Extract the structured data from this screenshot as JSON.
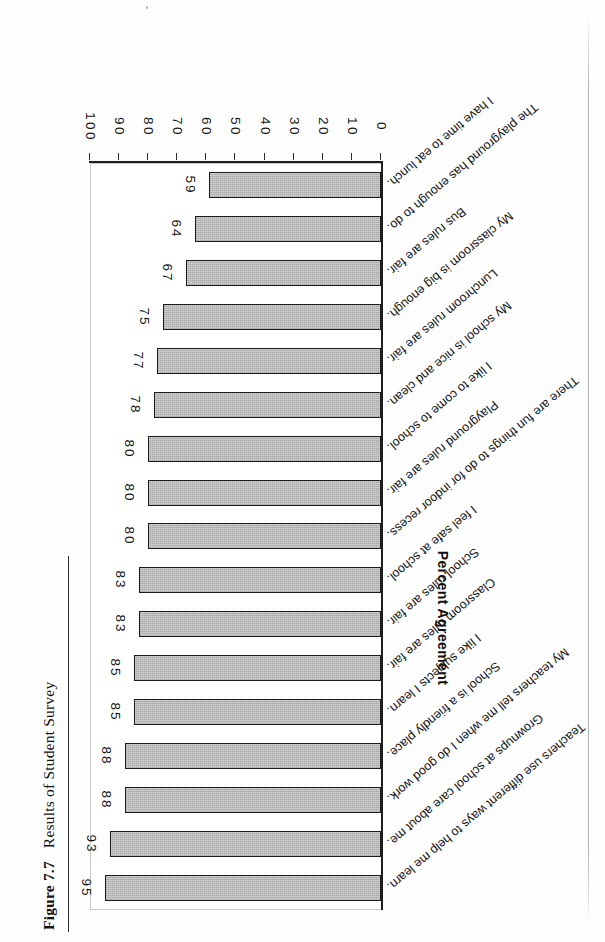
{
  "page": {
    "background_color": "#fefefe",
    "ink_color": "#141414"
  },
  "caption": {
    "label": "Figure 7.7",
    "title": "Results of Student Survey"
  },
  "chart_data": {
    "type": "bar",
    "orientation": "vertical",
    "title": "Results of Student Survey",
    "xlabel": "",
    "ylabel": "Percent Agreement",
    "ylim": [
      0,
      100
    ],
    "ytick_labels": [
      "100",
      "90",
      "80",
      "70",
      "60",
      "50",
      "40",
      "30",
      "20",
      "10",
      "0"
    ],
    "ytick_values": [
      100,
      90,
      80,
      70,
      60,
      50,
      40,
      30,
      20,
      10,
      0
    ],
    "grid": false,
    "legend": null,
    "bar_fill_color": "#a8a8a8",
    "bar_edge_color": "#1b1b1b",
    "show_value_labels": true,
    "categories": [
      "Teachers use different ways to help me learn.",
      "Grownups at school care about me.",
      "My teachers tell me when I do good work.",
      "School is a friendly place.",
      "I like subjects I learn.",
      "Classroom rules are fair.",
      "School rules are fair.",
      "I feel safe at school.",
      "There are fun things to do for indoor recess.",
      "Playground rules are fair.",
      "I like to come to school.",
      "My school is nice and clean.",
      "Lunchroom rules are fair.",
      "My classroom is big enough.",
      "Bus rules are fair.",
      "The playground has enough to do.",
      "I have time to eat lunch."
    ],
    "values": [
      95,
      93,
      88,
      88,
      85,
      85,
      83,
      83,
      80,
      80,
      80,
      78,
      77,
      75,
      67,
      64,
      59
    ]
  }
}
